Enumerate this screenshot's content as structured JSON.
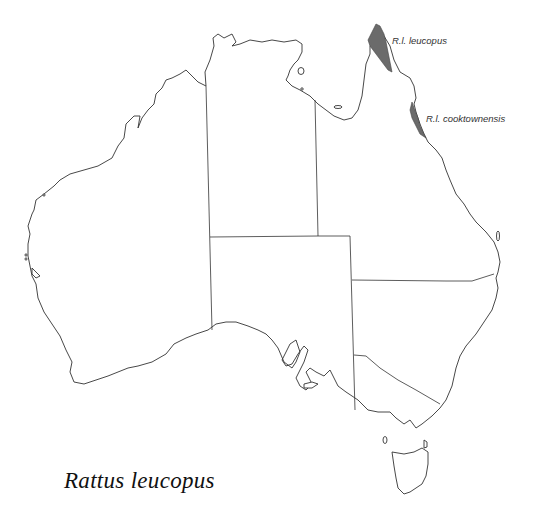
{
  "map": {
    "title": "Rattus leucopus",
    "region": "Australia",
    "labels": [
      {
        "id": "rl-leucopus",
        "text": "R.l. leucopus"
      },
      {
        "id": "rl-cooktownensis",
        "text": "R.l. cooktownensis"
      }
    ],
    "colors": {
      "range_fill": "#6b6b6b",
      "outline": "#333333",
      "background": "#ffffff"
    }
  }
}
